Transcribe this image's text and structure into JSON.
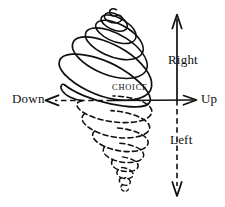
{
  "figure": {
    "background_color": "#ffffff",
    "ink_color": "#101010"
  },
  "labels": {
    "down": "Down",
    "up": "Up",
    "right": "Right",
    "left": "Left",
    "choice": "CHOICE"
  },
  "axes": {
    "horizontal": {
      "y": 100,
      "left_end": 45,
      "right_end": 197,
      "left_segment": {
        "label": "Down",
        "style": "dashed",
        "arrow": "left"
      },
      "right_segment": {
        "label": "Up",
        "style": "solid",
        "arrow": "right"
      }
    },
    "vertical": {
      "x": 177,
      "top_end": 14,
      "bottom_end": 196,
      "upper_segment": {
        "label": "Right",
        "style": "solid",
        "arrow": "up"
      },
      "lower_segment": {
        "label": "Left",
        "style": "dashed",
        "arrow": "down"
      }
    }
  },
  "spiral": {
    "upper": {
      "style": "solid",
      "description": "solid spiral widening downward from a small curl at the apex to the largest ellipse on the axis",
      "loops": 6,
      "apex": {
        "x": 117,
        "y": 10
      },
      "base": {
        "x": 113,
        "y": 100
      }
    },
    "lower": {
      "style": "dashed",
      "description": "dashed spiral narrowing downward from the axis ellipse to a tiny curl at the bottom tip",
      "loops": 6,
      "base": {
        "x": 113,
        "y": 100
      },
      "tip": {
        "x": 120,
        "y": 192
      }
    }
  }
}
